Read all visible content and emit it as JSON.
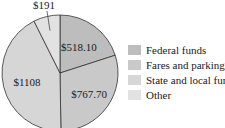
{
  "chart_data": {
    "type": "pie",
    "title": "",
    "slices": [
      {
        "name": "Federal funds",
        "value": 518.1,
        "label": "$518.10",
        "color": "#bdbdbd"
      },
      {
        "name": "Fares and parking",
        "value": 767.7,
        "label": "$767.70",
        "color": "#c9c9c9"
      },
      {
        "name": "State and local funds",
        "value": 1108,
        "label": "$1108",
        "color": "#d6d6d6"
      },
      {
        "name": "Other",
        "value": 191,
        "label": "$191",
        "color": "#e2e2e2"
      }
    ],
    "start_angle": "12 o'clock",
    "direction": "clockwise",
    "legend_position": "right",
    "legend": [
      "Federal funds",
      "Fares and parking",
      "State and local funds",
      "Other"
    ]
  }
}
